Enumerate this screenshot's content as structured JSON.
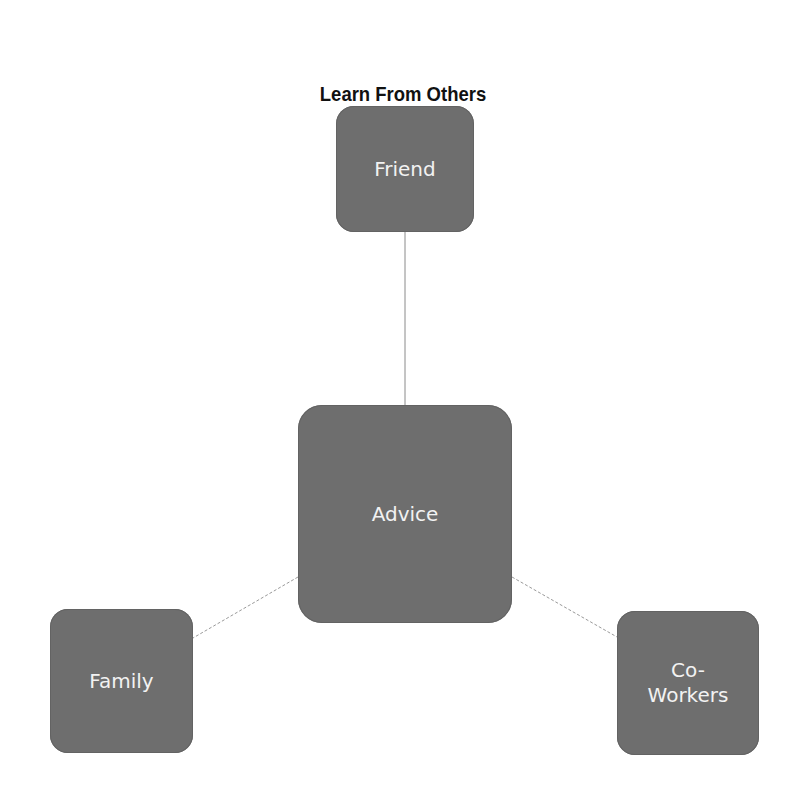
{
  "diagram": {
    "title": "Learn From Others",
    "center": {
      "label": "Advice"
    },
    "nodes": [
      {
        "id": "friend",
        "label": "Friend"
      },
      {
        "id": "family",
        "label": "Family"
      },
      {
        "id": "coworkers",
        "label": "Co-\nWorkers"
      }
    ],
    "edges": [
      {
        "from": "advice",
        "to": "friend",
        "style": "solid"
      },
      {
        "from": "advice",
        "to": "family",
        "style": "dashed"
      },
      {
        "from": "advice",
        "to": "coworkers",
        "style": "dashed"
      }
    ],
    "colors": {
      "node_fill": "#6e6e6e",
      "node_text": "#f2f2f2",
      "edge": "#999999",
      "title": "#111111"
    }
  }
}
